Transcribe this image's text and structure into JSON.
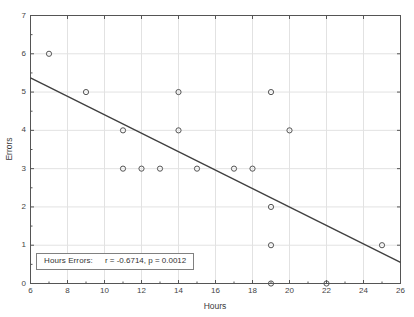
{
  "chart_data": {
    "type": "scatter",
    "title": "",
    "xlabel": "Hours",
    "ylabel": "Errors",
    "xlim": [
      6,
      26
    ],
    "ylim": [
      0,
      7
    ],
    "xticks": [
      6,
      8,
      10,
      12,
      14,
      16,
      18,
      20,
      22,
      24,
      26
    ],
    "yticks": [
      0,
      1,
      2,
      3,
      4,
      5,
      6,
      7
    ],
    "grid": true,
    "legend_position": "lower-left",
    "x": [
      7,
      9,
      11,
      11,
      12,
      13,
      14,
      14,
      15,
      17,
      18,
      19,
      19,
      19,
      19,
      20,
      22,
      25
    ],
    "y": [
      6,
      5,
      4,
      3,
      3,
      3,
      5,
      4,
      3,
      3,
      3,
      5,
      2,
      1,
      0,
      4,
      0,
      1
    ],
    "points": [
      {
        "x": 7,
        "y": 6
      },
      {
        "x": 9,
        "y": 5
      },
      {
        "x": 11,
        "y": 4
      },
      {
        "x": 11,
        "y": 3
      },
      {
        "x": 12,
        "y": 3
      },
      {
        "x": 13,
        "y": 3
      },
      {
        "x": 14,
        "y": 5
      },
      {
        "x": 14,
        "y": 4
      },
      {
        "x": 15,
        "y": 3
      },
      {
        "x": 17,
        "y": 3
      },
      {
        "x": 18,
        "y": 3
      },
      {
        "x": 19,
        "y": 5
      },
      {
        "x": 19,
        "y": 2
      },
      {
        "x": 19,
        "y": 1
      },
      {
        "x": 19,
        "y": 0
      },
      {
        "x": 20,
        "y": 4
      },
      {
        "x": 22,
        "y": 0
      },
      {
        "x": 25,
        "y": 1
      }
    ],
    "fit_line": {
      "x0": 6,
      "y0": 5.37,
      "x1": 26,
      "y1": 0.55,
      "slope": -0.241,
      "intercept": 6.816
    },
    "annotation": {
      "series_name": "Hours Errors:",
      "stats": "r = -0.6714, p = 0.0012",
      "r": -0.6714,
      "p": 0.0012
    },
    "colors": {
      "marker_stroke": "#555555",
      "fit_line": "#404040",
      "grid": "#e2e2e2",
      "axis": "#555555",
      "background": "#ffffff"
    }
  },
  "axes": {
    "x_title": "Hours",
    "y_title": "Errors",
    "x_tick_labels": [
      "6",
      "8",
      "10",
      "12",
      "14",
      "16",
      "18",
      "20",
      "22",
      "24",
      "26"
    ],
    "y_tick_labels": [
      "0",
      "1",
      "2",
      "3",
      "4",
      "5",
      "6",
      "7"
    ]
  },
  "legend": {
    "series_label": "Hours Errors:",
    "stats_label": "r = -0.6714, p = 0.0012"
  }
}
